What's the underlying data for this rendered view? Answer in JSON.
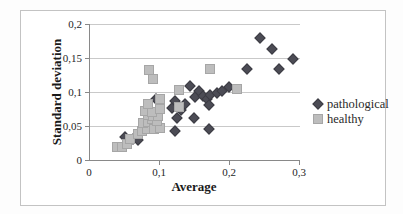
{
  "chart": {
    "y_axis_title": "Standard deviation",
    "x_axis_title": "Average",
    "y_ticks": [
      {
        "value": 0,
        "label": "0"
      },
      {
        "value": 0.05,
        "label": "0,05"
      },
      {
        "value": 0.1,
        "label": "0,1"
      },
      {
        "value": 0.15,
        "label": "0,15"
      },
      {
        "value": 0.2,
        "label": "0,2"
      }
    ],
    "x_ticks": [
      {
        "value": 0,
        "label": "0"
      },
      {
        "value": 0.1,
        "label": "0,1"
      },
      {
        "value": 0.2,
        "label": "0,2"
      },
      {
        "value": 0.3,
        "label": "0,3"
      }
    ],
    "colors": {
      "pathological": "#4c4c55",
      "pathological_border": "#3c3c44",
      "healthy": "#bdbdbd",
      "healthy_border": "#a6a6a6",
      "gridline": "#c9c9c9",
      "axis": "#898989",
      "frame_border": "#c3c3c3"
    }
  },
  "chart_data": {
    "type": "scatter",
    "title": "",
    "xlabel": "Average",
    "ylabel": "Standard deviation",
    "xlim": [
      0,
      0.3
    ],
    "ylim": [
      0,
      0.2
    ],
    "grid": "horizontal-major",
    "legend_position": "right",
    "decimal_separator": ",",
    "series": [
      {
        "name": "pathological",
        "marker": "diamond",
        "color": "#4c4c55",
        "points": [
          [
            0.05,
            0.034
          ],
          [
            0.061,
            0.031
          ],
          [
            0.068,
            0.029
          ],
          [
            0.094,
            0.09
          ],
          [
            0.117,
            0.077
          ],
          [
            0.121,
            0.087
          ],
          [
            0.124,
            0.062
          ],
          [
            0.13,
            0.073
          ],
          [
            0.136,
            0.082
          ],
          [
            0.122,
            0.043
          ],
          [
            0.143,
            0.109
          ],
          [
            0.148,
            0.062
          ],
          [
            0.15,
            0.093
          ],
          [
            0.155,
            0.101
          ],
          [
            0.161,
            0.094
          ],
          [
            0.167,
            0.089
          ],
          [
            0.171,
            0.096
          ],
          [
            0.17,
            0.081
          ],
          [
            0.181,
            0.099
          ],
          [
            0.189,
            0.101
          ],
          [
            0.199,
            0.107
          ],
          [
            0.17,
            0.046
          ],
          [
            0.224,
            0.134
          ],
          [
            0.27,
            0.134
          ],
          [
            0.243,
            0.18
          ],
          [
            0.26,
            0.163
          ],
          [
            0.29,
            0.148
          ]
        ]
      },
      {
        "name": "healthy",
        "marker": "square",
        "color": "#bdbdbd",
        "points": [
          [
            0.039,
            0.019
          ],
          [
            0.046,
            0.019
          ],
          [
            0.053,
            0.024
          ],
          [
            0.057,
            0.031
          ],
          [
            0.069,
            0.038
          ],
          [
            0.074,
            0.043
          ],
          [
            0.081,
            0.046
          ],
          [
            0.076,
            0.055
          ],
          [
            0.083,
            0.056
          ],
          [
            0.091,
            0.046
          ],
          [
            0.1,
            0.047
          ],
          [
            0.088,
            0.06
          ],
          [
            0.096,
            0.057
          ],
          [
            0.083,
            0.066
          ],
          [
            0.09,
            0.065
          ],
          [
            0.097,
            0.065
          ],
          [
            0.079,
            0.072
          ],
          [
            0.088,
            0.071
          ],
          [
            0.083,
            0.082
          ],
          [
            0.1,
            0.075
          ],
          [
            0.1,
            0.09
          ],
          [
            0.127,
            0.078
          ],
          [
            0.084,
            0.133
          ],
          [
            0.09,
            0.119
          ],
          [
            0.171,
            0.134
          ],
          [
            0.127,
            0.103
          ],
          [
            0.21,
            0.104
          ]
        ]
      }
    ]
  }
}
